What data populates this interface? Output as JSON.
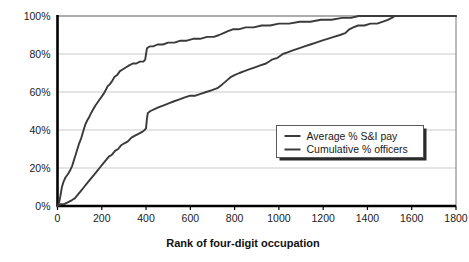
{
  "chart_data": {
    "type": "line",
    "title": "",
    "subtitle": "",
    "xlabel": "Rank of four-digit occupation",
    "ylabel": "",
    "xlim": [
      0,
      1800
    ],
    "ylim": [
      0,
      100
    ],
    "grid": true,
    "grid_axis": "y",
    "legend_position": "center-right",
    "x_ticks": [
      0,
      200,
      400,
      600,
      800,
      1000,
      1200,
      1400,
      1600,
      1800
    ],
    "x_tick_labels": [
      "0",
      "200",
      "400",
      "600",
      "800",
      "1000",
      "1200",
      "1400",
      "1600",
      "1800"
    ],
    "y_ticks": [
      0,
      20,
      40,
      60,
      80,
      100
    ],
    "y_tick_labels": [
      "0%",
      "20%",
      "40%",
      "60%",
      "80%",
      "100%"
    ],
    "series": [
      {
        "name": "Average % S&I pay",
        "color": "#3a3a3a",
        "points": [
          [
            0,
            0
          ],
          [
            8,
            2
          ],
          [
            14,
            6
          ],
          [
            20,
            10
          ],
          [
            28,
            13
          ],
          [
            36,
            15
          ],
          [
            48,
            17
          ],
          [
            58,
            19
          ],
          [
            66,
            21
          ],
          [
            74,
            24
          ],
          [
            82,
            27
          ],
          [
            90,
            30
          ],
          [
            98,
            33
          ],
          [
            108,
            36
          ],
          [
            118,
            40
          ],
          [
            126,
            43
          ],
          [
            134,
            45
          ],
          [
            144,
            47
          ],
          [
            152,
            49
          ],
          [
            162,
            51
          ],
          [
            172,
            53
          ],
          [
            184,
            55
          ],
          [
            196,
            57
          ],
          [
            208,
            59
          ],
          [
            218,
            61
          ],
          [
            226,
            63
          ],
          [
            236,
            64
          ],
          [
            248,
            66
          ],
          [
            258,
            68
          ],
          [
            270,
            69
          ],
          [
            282,
            71
          ],
          [
            296,
            72
          ],
          [
            310,
            73
          ],
          [
            324,
            74
          ],
          [
            340,
            75
          ],
          [
            356,
            75
          ],
          [
            372,
            76
          ],
          [
            388,
            76
          ],
          [
            396,
            77
          ],
          [
            400,
            80
          ],
          [
            404,
            83
          ],
          [
            416,
            84
          ],
          [
            432,
            84
          ],
          [
            452,
            85
          ],
          [
            476,
            85
          ],
          [
            500,
            86
          ],
          [
            528,
            86
          ],
          [
            556,
            87
          ],
          [
            584,
            87
          ],
          [
            612,
            88
          ],
          [
            644,
            88
          ],
          [
            676,
            89
          ],
          [
            706,
            89
          ],
          [
            730,
            90
          ],
          [
            750,
            91
          ],
          [
            770,
            92
          ],
          [
            792,
            93
          ],
          [
            818,
            93
          ],
          [
            850,
            94
          ],
          [
            886,
            94
          ],
          [
            922,
            95
          ],
          [
            960,
            95
          ],
          [
            1000,
            96
          ],
          [
            1046,
            96
          ],
          [
            1094,
            97
          ],
          [
            1142,
            97
          ],
          [
            1190,
            98
          ],
          [
            1238,
            98
          ],
          [
            1286,
            99
          ],
          [
            1326,
            99
          ],
          [
            1360,
            100
          ],
          [
            1800,
            100
          ]
        ]
      },
      {
        "name": "Cumulative % officers",
        "color": "#3a3a3a",
        "points": [
          [
            0,
            0
          ],
          [
            14,
            1
          ],
          [
            30,
            1
          ],
          [
            48,
            2
          ],
          [
            64,
            3
          ],
          [
            78,
            4
          ],
          [
            92,
            6
          ],
          [
            106,
            8
          ],
          [
            120,
            10
          ],
          [
            134,
            12
          ],
          [
            148,
            14
          ],
          [
            162,
            16
          ],
          [
            176,
            18
          ],
          [
            190,
            20
          ],
          [
            204,
            22
          ],
          [
            218,
            24
          ],
          [
            232,
            26
          ],
          [
            246,
            27
          ],
          [
            260,
            29
          ],
          [
            274,
            30
          ],
          [
            288,
            32
          ],
          [
            302,
            33
          ],
          [
            318,
            34
          ],
          [
            334,
            36
          ],
          [
            350,
            37
          ],
          [
            366,
            38
          ],
          [
            382,
            39
          ],
          [
            394,
            40
          ],
          [
            400,
            41
          ],
          [
            404,
            46
          ],
          [
            408,
            49
          ],
          [
            420,
            50
          ],
          [
            438,
            51
          ],
          [
            458,
            52
          ],
          [
            480,
            53
          ],
          [
            502,
            54
          ],
          [
            524,
            55
          ],
          [
            548,
            56
          ],
          [
            572,
            57
          ],
          [
            596,
            58
          ],
          [
            620,
            58
          ],
          [
            646,
            59
          ],
          [
            672,
            60
          ],
          [
            698,
            61
          ],
          [
            722,
            62
          ],
          [
            744,
            64
          ],
          [
            764,
            66
          ],
          [
            784,
            68
          ],
          [
            802,
            69
          ],
          [
            822,
            70
          ],
          [
            844,
            71
          ],
          [
            868,
            72
          ],
          [
            892,
            73
          ],
          [
            916,
            74
          ],
          [
            942,
            75
          ],
          [
            968,
            77
          ],
          [
            994,
            78
          ],
          [
            1018,
            80
          ],
          [
            1042,
            81
          ],
          [
            1066,
            82
          ],
          [
            1090,
            83
          ],
          [
            1116,
            84
          ],
          [
            1142,
            85
          ],
          [
            1168,
            86
          ],
          [
            1194,
            87
          ],
          [
            1220,
            88
          ],
          [
            1248,
            89
          ],
          [
            1276,
            90
          ],
          [
            1300,
            91
          ],
          [
            1318,
            93
          ],
          [
            1336,
            94
          ],
          [
            1358,
            95
          ],
          [
            1386,
            95
          ],
          [
            1414,
            96
          ],
          [
            1444,
            96
          ],
          [
            1470,
            97
          ],
          [
            1492,
            98
          ],
          [
            1510,
            99
          ],
          [
            1524,
            100
          ],
          [
            1800,
            100
          ]
        ]
      }
    ]
  },
  "legend": {
    "items": [
      {
        "label": "Average % S&I pay"
      },
      {
        "label": "Cumulative % officers"
      }
    ]
  },
  "colors": {
    "line": "#3a3a3a",
    "axis": "#000000",
    "grid": "#c9c9c9",
    "text": "#1a1a1a",
    "legend_bg": "#ffffff",
    "legend_border": "#5a5a5a",
    "legend_shadow": "#2b2b2b",
    "background": "#ffffff"
  }
}
